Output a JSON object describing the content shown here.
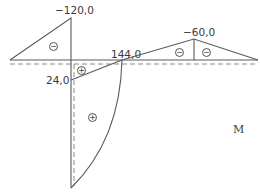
{
  "diagram": {
    "title": "M",
    "labels": {
      "left_peak": "−120,0",
      "right_peak": "−60,0",
      "zero_crossing": "144,0",
      "support_value": "24,0"
    },
    "signs": {
      "left_triangle": "−",
      "right_triangle_left": "−",
      "right_triangle_right": "−",
      "small_positive": "+",
      "large_positive": "+"
    },
    "colors": {
      "line": "#5a5a5a",
      "dashed": "#8a8a8a",
      "text": "#3a3a3a"
    }
  }
}
